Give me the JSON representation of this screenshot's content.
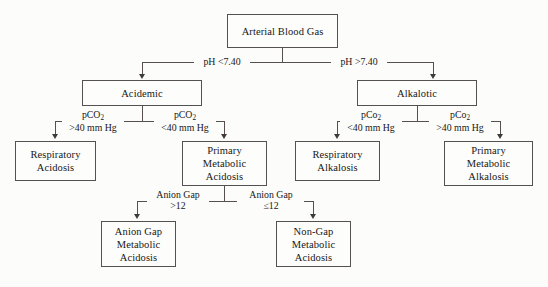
{
  "diagram": {
    "title": "Arterial Blood Gas",
    "nodes": {
      "root": {
        "lines": [
          "Arterial Blood Gas"
        ]
      },
      "acidemic": {
        "lines": [
          "Acidemic"
        ]
      },
      "alkalotic": {
        "lines": [
          "Alkalotic"
        ]
      },
      "resp_acid": {
        "lines": [
          "Respiratory",
          "Acidosis"
        ]
      },
      "prim_met_acid": {
        "lines": [
          "Primary",
          "Metabolic",
          "Acidosis"
        ]
      },
      "resp_alk": {
        "lines": [
          "Respiratory",
          "Alkalosis"
        ]
      },
      "prim_met_alk": {
        "lines": [
          "Primary",
          "Metabolic",
          "Alkalosis"
        ]
      },
      "anion_gap_acid": {
        "lines": [
          "Anion Gap",
          "Metabolic",
          "Acidosis"
        ]
      },
      "non_gap_acid": {
        "lines": [
          "Non-Gap",
          "Metabolic",
          "Acidosis"
        ]
      }
    },
    "edges": {
      "ph_low": {
        "l1": "pH <7.40",
        "l2": ""
      },
      "ph_high": {
        "l1": "pH >7.40",
        "l2": ""
      },
      "pco2_high_left": {
        "pre": "pCO",
        "sub": "2",
        "l2": ">40 mm Hg"
      },
      "pco2_low_left": {
        "pre": "pCO",
        "sub": "2",
        "l2": "<40 mm Hg"
      },
      "pco2_low_right": {
        "pre": "pCo",
        "sub": "2",
        "l2": "<40 mm Hg"
      },
      "pco2_high_right": {
        "pre": "pCo",
        "sub": "2",
        "l2": ">40 mm Hg"
      },
      "ag_high": {
        "l1": "Anion Gap",
        "l2": ">12"
      },
      "ag_low": {
        "l1": "Anion Gap",
        "l2": "≤12"
      }
    },
    "colors": {
      "border": "#555052",
      "text": "#171717",
      "background": "#fcfcfa"
    }
  }
}
